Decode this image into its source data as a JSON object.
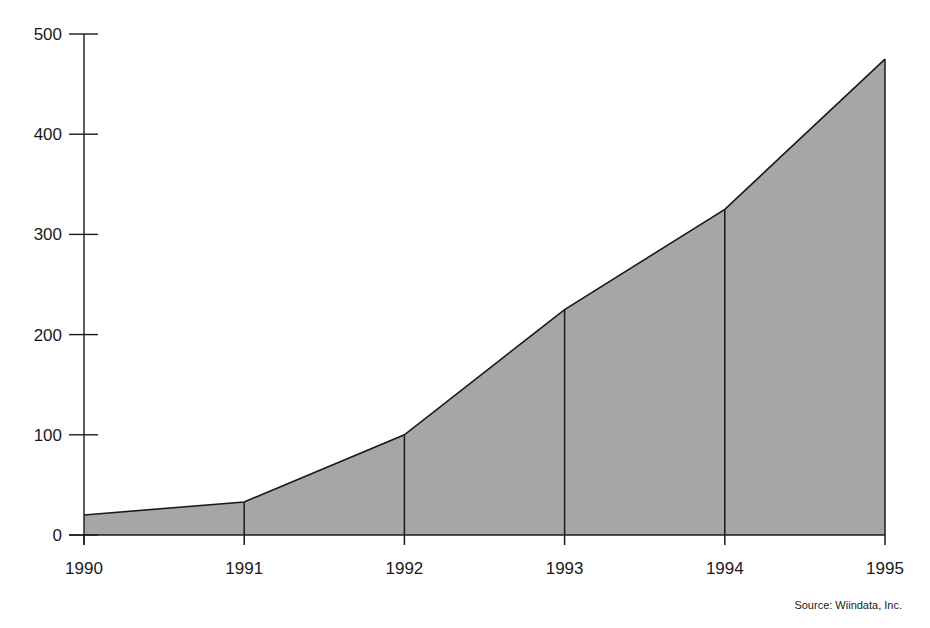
{
  "chart_data": {
    "type": "area",
    "title": "",
    "xlabel": "",
    "ylabel": "",
    "categories": [
      "1990",
      "1991",
      "1992",
      "1993",
      "1994",
      "1995"
    ],
    "values": [
      20,
      33,
      100,
      225,
      325,
      475
    ],
    "ylim": [
      0,
      500
    ],
    "yticks": [
      0,
      100,
      200,
      300,
      400,
      500
    ],
    "grid": false,
    "legend": null,
    "fill_color": "#a6a6a6",
    "line_color": "#1a1a1a",
    "annotations": [
      "Source:  Wiindata, Inc."
    ]
  },
  "source_note": "Source:  Wiindata, Inc."
}
